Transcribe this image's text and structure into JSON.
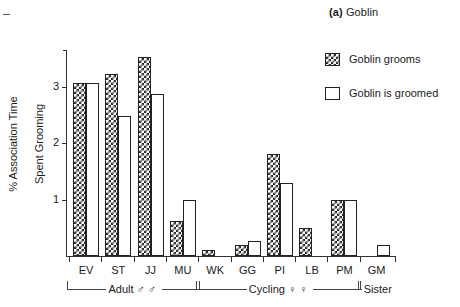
{
  "title": {
    "tag": "(a)",
    "name": "Goblin"
  },
  "legend": {
    "position": "top-right",
    "items": [
      {
        "label": "Goblin grooms",
        "swatch": "checker-swatch-icon",
        "pattern": "checkered"
      },
      {
        "label": "Goblin is groomed",
        "swatch": "open-swatch-icon",
        "pattern": "open"
      }
    ]
  },
  "axes": {
    "ylabel_line1": "% Association Time",
    "ylabel_line2": "Spent Grooming",
    "ylabel": "% Association Time\nSpent Grooming",
    "yticks": [
      "1",
      "2",
      "3"
    ],
    "xlabel": ""
  },
  "groups": [
    {
      "label": "Adult ♂ ♂",
      "members": [
        "EV",
        "ST",
        "JJ",
        "MU"
      ]
    },
    {
      "label": "Cycling ♀ ♀",
      "members": [
        "WK",
        "GG",
        "PI",
        "LB",
        "PM"
      ]
    },
    {
      "label": "Sister",
      "members": [
        "GM"
      ]
    }
  ],
  "chart_data": {
    "type": "bar",
    "title": "(a) Goblin",
    "xlabel": "",
    "ylabel": "% Association Time Spent Grooming",
    "ylim": [
      0,
      3.7
    ],
    "yticks": [
      1,
      2,
      3
    ],
    "grid": false,
    "legend_position": "top-right",
    "categories": [
      "EV",
      "ST",
      "JJ",
      "MU",
      "WK",
      "GG",
      "PI",
      "LB",
      "PM",
      "GM"
    ],
    "category_groups": [
      "Adult ♂ ♂",
      "Adult ♂ ♂",
      "Adult ♂ ♂",
      "Adult ♂ ♂",
      "Cycling ♀ ♀",
      "Cycling ♀ ♀",
      "Cycling ♀ ♀",
      "Cycling ♀ ♀",
      "Cycling ♀ ♀",
      "Sister"
    ],
    "series": [
      {
        "name": "Goblin grooms",
        "pattern": "checkered",
        "values": [
          3.07,
          3.22,
          3.52,
          0.62,
          0.1,
          0.2,
          1.8,
          0.5,
          1.0,
          0
        ]
      },
      {
        "name": "Goblin is groomed",
        "pattern": "open",
        "values": [
          3.07,
          2.47,
          2.87,
          1.0,
          0,
          0.27,
          1.3,
          0,
          1.0,
          0.2
        ]
      }
    ]
  },
  "colors": {
    "axis": "#333333",
    "pattern_dark": "#2b2b2b",
    "background": "#ffffff",
    "text": "#1a1a1a"
  }
}
